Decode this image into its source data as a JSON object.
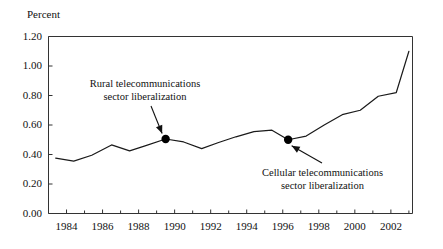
{
  "chart_data": {
    "type": "line",
    "title": "",
    "ylabel": "Percent",
    "xlabel": "",
    "ylim": [
      0.0,
      1.2
    ],
    "xlim": [
      1983.0,
      2003.2
    ],
    "grid": false,
    "legend": "none",
    "ytick_labels": [
      "1.20",
      "1.00",
      "0.80",
      "0.60",
      "0.40",
      "0.20",
      "0.00"
    ],
    "ytick_values": [
      1.2,
      1.0,
      0.8,
      0.6,
      0.4,
      0.2,
      0.0
    ],
    "xtick_labels": [
      "1984",
      "1986",
      "1988",
      "1990",
      "1992",
      "1994",
      "1996",
      "1998",
      "2000",
      "2002"
    ],
    "xtick_values": [
      1984,
      1986,
      1988,
      1990,
      1992,
      1994,
      1996,
      1998,
      2000,
      2002
    ],
    "xtick_minor_values": [
      1985,
      1987,
      1989,
      1991,
      1993,
      1995,
      1997,
      1999,
      2001,
      2003
    ],
    "x": [
      1983.4,
      1984.4,
      1985.4,
      1986.5,
      1987.5,
      1988.4,
      1989.5,
      1990.5,
      1991.5,
      1992.4,
      1993.4,
      1994.4,
      1995.4,
      1996.3,
      1997.3,
      1998.3,
      1999.3,
      2000.3,
      2001.3,
      2002.3,
      2003.0
    ],
    "values": [
      0.375,
      0.355,
      0.395,
      0.465,
      0.425,
      0.46,
      0.505,
      0.485,
      0.44,
      0.48,
      0.52,
      0.555,
      0.565,
      0.5,
      0.525,
      0.6,
      0.67,
      0.7,
      0.795,
      0.82,
      1.1
    ],
    "series": [
      {
        "name": "Percent",
        "values": [
          0.375,
          0.355,
          0.395,
          0.465,
          0.425,
          0.46,
          0.505,
          0.485,
          0.44,
          0.48,
          0.52,
          0.555,
          0.565,
          0.5,
          0.525,
          0.6,
          0.67,
          0.7,
          0.795,
          0.82,
          1.1
        ]
      }
    ],
    "markers": [
      {
        "x": 1989.5,
        "y": 0.505,
        "label": "rural-marker"
      },
      {
        "x": 1996.3,
        "y": 0.5,
        "label": "cellular-marker"
      }
    ],
    "annotations": [
      {
        "name": "rural-annotation",
        "line1": "Rural telecommunications",
        "line2": "sector liberalization",
        "points_to": {
          "x": 1989.5,
          "y": 0.505
        }
      },
      {
        "name": "cellular-annotation",
        "line1": "Cellular telecommunications",
        "line2": "sector liberalization",
        "points_to": {
          "x": 1996.3,
          "y": 0.5
        }
      }
    ],
    "line_color": "#1a1a1a",
    "marker_color": "#000000",
    "axis_color": "#333333",
    "background_color": "#ffffff"
  }
}
